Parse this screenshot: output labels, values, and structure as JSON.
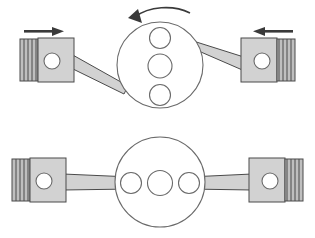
{
  "diagram": {
    "colors": {
      "part_fill": "#d2d2d2",
      "part_fill_dark": "#bfbfbf",
      "outline": "#4a4a4a",
      "disc_outline": "#6a6a6a",
      "arrow": "#3a3a3a",
      "background": "#ffffff"
    },
    "rows": [
      {
        "id": "top-row",
        "label": "Pistons moving inward, crank rotating counter-clockwise",
        "crank": {
          "label": "crank-disc-top",
          "cx": 160,
          "cy": 65,
          "r": 43,
          "holes": [
            {
              "label": "crank-hole-upper",
              "cx": 160,
              "cy": 38,
              "r": 10.5
            },
            {
              "label": "crank-hole-center",
              "cx": 160,
              "cy": 66,
              "r": 12
            },
            {
              "label": "crank-hole-lower",
              "cx": 160,
              "cy": 95,
              "r": 10.5
            }
          ],
          "hole_orientation": "vertical"
        },
        "rotation_arrow": {
          "label": "rotation-arrow-counterclockwise",
          "direction": "counter-clockwise",
          "visible": true
        },
        "pistons": [
          {
            "label": "piston-left-top",
            "side": "left",
            "body_x": 38,
            "body_y": 38,
            "body_w": 36,
            "body_h": 44,
            "rings": 4,
            "pin_cx": 52,
            "pin_cy": 61,
            "pin_r": 8,
            "travel_arrow": {
              "label": "travel-arrow-left-top",
              "direction": "right",
              "visible": true
            }
          },
          {
            "label": "piston-right-top",
            "side": "right",
            "body_x": 241,
            "body_y": 38,
            "body_w": 36,
            "body_h": 44,
            "rings": 4,
            "pin_cx": 262,
            "pin_cy": 61,
            "pin_r": 8,
            "travel_arrow": {
              "label": "travel-arrow-right-top",
              "direction": "left",
              "visible": true
            }
          }
        ],
        "rods": [
          {
            "label": "connecting-rod-left-top",
            "from": "piston-left-top",
            "to": "crank-disc-top",
            "angle": "down-right"
          },
          {
            "label": "connecting-rod-right-top",
            "from": "crank-disc-top",
            "to": "piston-right-top",
            "angle": "down-right"
          }
        ]
      },
      {
        "id": "bottom-row",
        "label": "Pistons at outer position, crank quarter turn further",
        "crank": {
          "label": "crank-disc-bottom",
          "cx": 160,
          "cy": 182,
          "r": 45,
          "holes": [
            {
              "label": "crank-hole-left",
              "cx": 131,
              "cy": 183,
              "r": 10.5
            },
            {
              "label": "crank-hole-center",
              "cx": 160,
              "cy": 183,
              "r": 12.5
            },
            {
              "label": "crank-hole-right",
              "cx": 189,
              "cy": 183,
              "r": 10.5
            }
          ],
          "hole_orientation": "horizontal"
        },
        "rotation_arrow": {
          "label": "rotation-arrow-bottom",
          "direction": "none",
          "visible": false
        },
        "pistons": [
          {
            "label": "piston-left-bottom",
            "side": "left",
            "body_x": 30,
            "body_y": 158,
            "body_w": 36,
            "body_h": 44,
            "rings": 4,
            "pin_cx": 44,
            "pin_cy": 181,
            "pin_r": 8,
            "travel_arrow": {
              "label": "travel-arrow-left-bottom",
              "direction": "none",
              "visible": false
            }
          },
          {
            "label": "piston-right-bottom",
            "side": "right",
            "body_x": 249,
            "body_y": 158,
            "body_w": 36,
            "body_h": 44,
            "rings": 4,
            "pin_cx": 270,
            "pin_cy": 181,
            "pin_r": 8,
            "travel_arrow": {
              "label": "travel-arrow-right-bottom",
              "direction": "none",
              "visible": false
            }
          }
        ],
        "rods": [
          {
            "label": "connecting-rod-left-bottom",
            "from": "piston-left-bottom",
            "to": "crank-disc-bottom",
            "angle": "horizontal"
          },
          {
            "label": "connecting-rod-right-bottom",
            "from": "crank-disc-bottom",
            "to": "piston-right-bottom",
            "angle": "horizontal"
          }
        ]
      }
    ]
  }
}
